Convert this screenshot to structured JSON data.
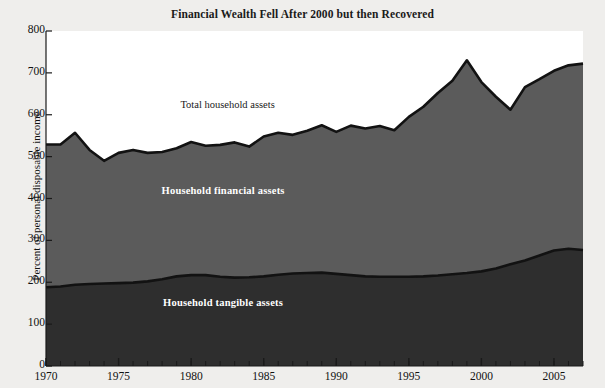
{
  "chart_data": {
    "type": "area",
    "title": "Financial Wealth Fell After 2000 but then Recovered",
    "subtitle": "",
    "xlabel": "",
    "ylabel": "Percent of personal disposable income",
    "stacked": true,
    "grid": false,
    "legend_position": "inline-annotations",
    "xlim": [
      1970,
      2007
    ],
    "ylim": [
      0,
      800
    ],
    "ytick_labels": [
      "0",
      "100",
      "200",
      "300",
      "400",
      "500",
      "600",
      "700",
      "800"
    ],
    "ytick_values": [
      0,
      100,
      200,
      300,
      400,
      500,
      600,
      700,
      800
    ],
    "xtick_labels": [
      "1970",
      "1975",
      "1980",
      "1985",
      "1990",
      "1995",
      "2000",
      "2005"
    ],
    "xtick_values": [
      1970,
      1975,
      1980,
      1985,
      1990,
      1995,
      2000,
      2005
    ],
    "x_minor_tick_interval": 1,
    "x": [
      1970,
      1971,
      1972,
      1973,
      1974,
      1975,
      1976,
      1977,
      1978,
      1979,
      1980,
      1981,
      1982,
      1983,
      1984,
      1985,
      1986,
      1987,
      1988,
      1989,
      1990,
      1991,
      1992,
      1993,
      1994,
      1995,
      1996,
      1997,
      1998,
      1999,
      2000,
      2001,
      2002,
      2003,
      2004,
      2005,
      2006,
      2007
    ],
    "series": [
      {
        "name": "Household tangible assets",
        "color": "#2e2e2e",
        "label_color": "#ffffff",
        "values": [
          188,
          190,
          194,
          196,
          197,
          198,
          199,
          202,
          207,
          214,
          217,
          217,
          213,
          211,
          212,
          214,
          218,
          221,
          222,
          223,
          220,
          217,
          214,
          213,
          213,
          213,
          214,
          216,
          219,
          222,
          226,
          233,
          243,
          252,
          264,
          276,
          280,
          277
        ]
      },
      {
        "name": "Household financial assets",
        "color": "#5b5b5b",
        "label_color": "#ffffff",
        "values": [
          341,
          339,
          363,
          320,
          293,
          311,
          317,
          307,
          304,
          306,
          318,
          309,
          315,
          323,
          312,
          334,
          339,
          331,
          340,
          352,
          339,
          357,
          353,
          360,
          350,
          382,
          405,
          436,
          462,
          508,
          452,
          410,
          369,
          414,
          421,
          429,
          438,
          445
        ]
      }
    ],
    "total_series": {
      "name": "Total household assets",
      "color": "#141414",
      "label_color": "#1a1a1a",
      "values": [
        529,
        529,
        557,
        516,
        490,
        509,
        516,
        509,
        511,
        520,
        535,
        526,
        528,
        534,
        524,
        548,
        557,
        552,
        562,
        575,
        559,
        574,
        567,
        573,
        563,
        595,
        619,
        652,
        681,
        730,
        678,
        643,
        612,
        666,
        685,
        705,
        718,
        722
      ]
    },
    "annotations": [
      {
        "text": "Total household assets",
        "x": 1982.5,
        "y": 620,
        "style": "dark"
      },
      {
        "text": "Household financial assets",
        "x": 1982.2,
        "y": 415,
        "style": "light"
      },
      {
        "text": "Household tangible assets",
        "x": 1982.2,
        "y": 148,
        "style": "light"
      }
    ],
    "colors": {
      "background": "#efeeec",
      "plot_background": "#ffffff",
      "tangible": "#2e2e2e",
      "financial": "#5b5b5b",
      "line": "#121212",
      "axis": "#1a1a1a",
      "text": "#111111"
    }
  }
}
